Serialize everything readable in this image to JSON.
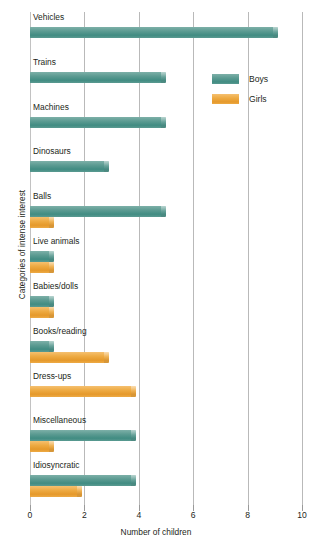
{
  "chart_data": {
    "type": "bar",
    "orientation": "horizontal",
    "title": "",
    "xlabel": "Number of children",
    "ylabel": "Categories of intense interest",
    "xlim": [
      0,
      10
    ],
    "xticks": [
      0,
      2,
      4,
      6,
      8,
      10
    ],
    "xtick_labels": [
      "0",
      "2",
      "4",
      "6",
      "8",
      "10"
    ],
    "grid": true,
    "grid_axis": "x",
    "legend": {
      "position": "upper-right-inside",
      "entries": [
        {
          "name": "Boys",
          "color": "#4f9189"
        },
        {
          "name": "Girls",
          "color": "#eaa135"
        }
      ]
    },
    "categories": [
      "Vehicles",
      "Trains",
      "Machines",
      "Dinosaurs",
      "Balls",
      "Live animals",
      "Babies/dolls",
      "Books/reading",
      "Dress-ups",
      "Miscellaneous",
      "Idiosyncratic"
    ],
    "series": [
      {
        "name": "Boys",
        "color": "#4f9189",
        "values": [
          9.1,
          5.0,
          5.0,
          2.9,
          5.0,
          0.9,
          0.9,
          0.9,
          0,
          3.9,
          3.9
        ]
      },
      {
        "name": "Girls",
        "color": "#eaa135",
        "values": [
          0,
          0,
          0,
          0,
          0.9,
          0.9,
          0.9,
          2.9,
          3.9,
          0.9,
          1.9
        ]
      }
    ]
  }
}
